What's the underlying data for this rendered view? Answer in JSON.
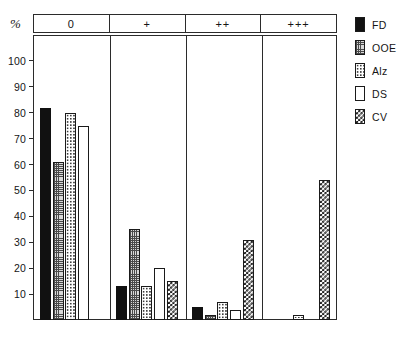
{
  "axis": {
    "unit_label": "%",
    "y_ticks": [
      10,
      20,
      30,
      40,
      50,
      60,
      70,
      80,
      90,
      100
    ]
  },
  "legend": {
    "items": [
      {
        "label": "FD",
        "pattern": "solid-black",
        "swatch_name": "legend-swatch-fd"
      },
      {
        "label": "OOE",
        "pattern": "fine-grid-gray",
        "swatch_name": "legend-swatch-ooe"
      },
      {
        "label": "Alz",
        "pattern": "dotted",
        "swatch_name": "legend-swatch-alz"
      },
      {
        "label": "DS",
        "pattern": "white",
        "swatch_name": "legend-swatch-ds"
      },
      {
        "label": "CV",
        "pattern": "checkerboard",
        "swatch_name": "legend-swatch-cv"
      }
    ]
  },
  "chart_data": {
    "type": "bar",
    "title": "",
    "xlabel": "",
    "ylabel": "%",
    "ylim": [
      0,
      110
    ],
    "grid": false,
    "legend_position": "right",
    "categories": [
      "0",
      "+",
      "++",
      "+++"
    ],
    "series": [
      {
        "name": "FD",
        "values": [
          82,
          13,
          5,
          0
        ]
      },
      {
        "name": "OOE",
        "values": [
          61,
          35,
          2,
          0
        ]
      },
      {
        "name": "Alz",
        "values": [
          80,
          13,
          7,
          2
        ]
      },
      {
        "name": "DS",
        "values": [
          75,
          20,
          4,
          0
        ]
      },
      {
        "name": "CV",
        "values": [
          0,
          15,
          31,
          54
        ]
      }
    ]
  }
}
